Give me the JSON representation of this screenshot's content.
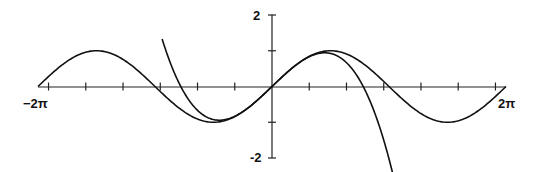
{
  "chart_data": {
    "type": "line",
    "title": "",
    "xlabel": "",
    "ylabel": "",
    "xlim": [
      -6.2832,
      6.2832
    ],
    "ylim": [
      -2,
      2
    ],
    "x_tick_labels": [
      "-2π",
      "2π"
    ],
    "y_tick_labels": [
      "2",
      "-2"
    ],
    "x_ticks": [
      -6,
      -5,
      -4,
      -3,
      -2,
      -1,
      1,
      2,
      3,
      4,
      5,
      6
    ],
    "y_ticks": [
      -2,
      -1,
      1,
      2
    ],
    "grid": false,
    "legend": null,
    "series": [
      {
        "name": "sin(x)",
        "expr": "sin(x)",
        "domain": [
          -6.2832,
          6.2832
        ]
      },
      {
        "name": "x - x^3/6",
        "expr": "x - x^3/6",
        "domain": [
          -2.95,
          3.3
        ]
      }
    ]
  },
  "labels": {
    "x_min": "−2π",
    "x_max": "2π",
    "y_max": "2",
    "y_min": "-2"
  }
}
